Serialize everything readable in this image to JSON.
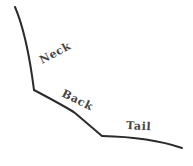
{
  "diagram": {
    "stroke_color": "#2b2b2b",
    "label_color": "#444444",
    "segments": [
      {
        "name": "neck",
        "label": "Neck"
      },
      {
        "name": "back",
        "label": "Back"
      },
      {
        "name": "tail",
        "label": "Tail"
      }
    ]
  }
}
